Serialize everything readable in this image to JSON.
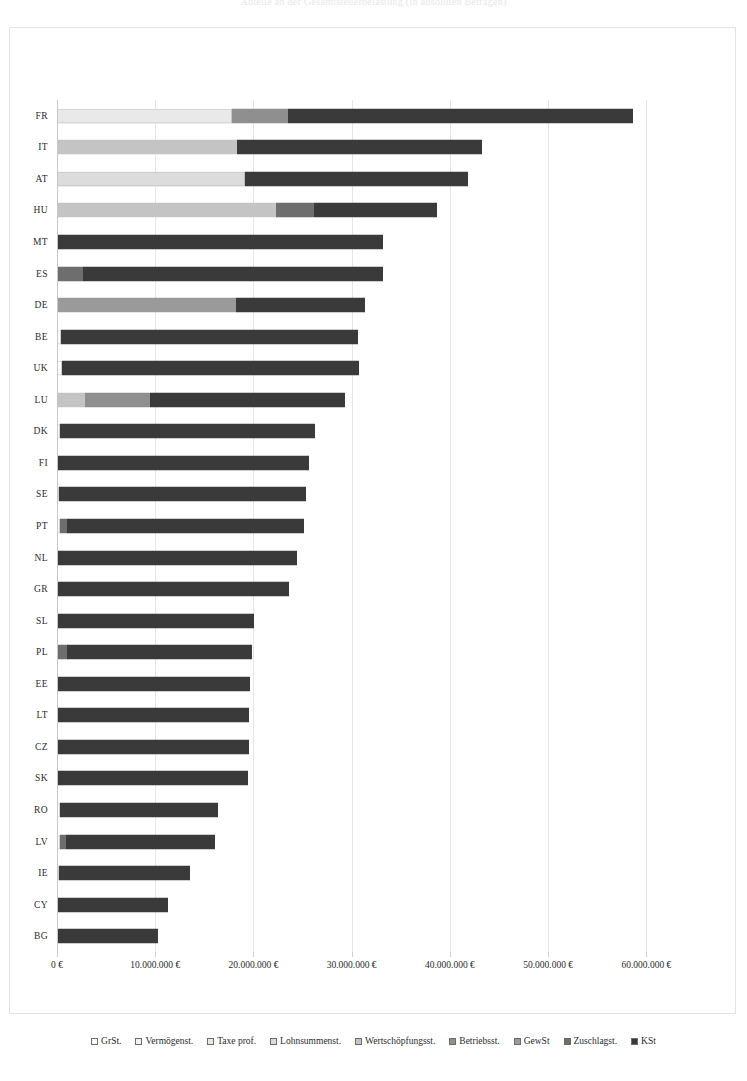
{
  "chart": {
    "title": "Anteile an der Gesamtsteuerbelastung (in absoluten Beträgen)",
    "xlabel": "",
    "ylabel": ""
  },
  "chart_data": {
    "type": "bar",
    "orientation": "horizontal",
    "stacked": true,
    "title": "Anteile an der Gesamtsteuerbelastung (in absoluten Beträgen)",
    "xlabel": "",
    "ylabel": "",
    "xlim": [
      0,
      62000000
    ],
    "grid": true,
    "legend_position": "bottom",
    "xticks": [
      0,
      10000000,
      20000000,
      30000000,
      40000000,
      50000000,
      60000000
    ],
    "xticklabels": [
      "0 €",
      "10.000.000 €",
      "20.000.000 €",
      "30.000.000 €",
      "40.000.000 €",
      "50.000.000 €",
      "60.000.000 €"
    ],
    "categories": [
      "FR",
      "IT",
      "AT",
      "HU",
      "MT",
      "ES",
      "DE",
      "BE",
      "UK",
      "LU",
      "DK",
      "FI",
      "SE",
      "PT",
      "NL",
      "GR",
      "SL",
      "PL",
      "EE",
      "LT",
      "CZ",
      "SK",
      "RO",
      "LV",
      "IE",
      "CY",
      "BG"
    ],
    "series": [
      {
        "name": "GrSt.",
        "color": "#fdfdfd",
        "values": [
          0,
          0,
          0,
          0,
          0,
          0,
          0,
          420000,
          520000,
          0,
          350000,
          0,
          250000,
          300000,
          0,
          0,
          0,
          0,
          0,
          0,
          0,
          0,
          300000,
          260000,
          220000,
          0,
          0
        ]
      },
      {
        "name": "Vermögenst.",
        "color": "#f2f2f2",
        "values": [
          0,
          0,
          0,
          0,
          0,
          0,
          0,
          0,
          0,
          0,
          0,
          0,
          0,
          0,
          0,
          0,
          0,
          0,
          0,
          0,
          0,
          0,
          0,
          0,
          0,
          0,
          0
        ]
      },
      {
        "name": "Taxe prof.",
        "color": "#e9e9e9",
        "values": [
          17800000,
          0,
          0,
          0,
          0,
          0,
          0,
          0,
          0,
          0,
          0,
          0,
          0,
          0,
          0,
          0,
          0,
          0,
          0,
          0,
          0,
          0,
          0,
          0,
          0,
          0,
          0
        ]
      },
      {
        "name": "Lohnsummenst.",
        "color": "#dcdcdc",
        "values": [
          0,
          0,
          19100000,
          0,
          0,
          0,
          0,
          0,
          0,
          0,
          0,
          0,
          0,
          0,
          0,
          0,
          0,
          0,
          0,
          0,
          0,
          0,
          0,
          0,
          0,
          0,
          0
        ]
      },
      {
        "name": "Wertschöpfungsst.",
        "color": "#c4c4c4",
        "values": [
          0,
          18300000,
          0,
          22300000,
          0,
          0,
          0,
          0,
          0,
          2900000,
          0,
          0,
          0,
          0,
          0,
          0,
          0,
          0,
          0,
          0,
          0,
          0,
          0,
          0,
          0,
          0,
          0
        ]
      },
      {
        "name": "Betriebsst.",
        "color": "#8f8f8f",
        "values": [
          5700000,
          0,
          0,
          0,
          0,
          0,
          0,
          0,
          0,
          6600000,
          0,
          0,
          0,
          0,
          0,
          0,
          0,
          0,
          0,
          0,
          0,
          0,
          0,
          0,
          0,
          0,
          0
        ]
      },
      {
        "name": "GewSt",
        "color": "#9a9a9a",
        "values": [
          0,
          0,
          0,
          0,
          0,
          0,
          18200000,
          0,
          0,
          0,
          0,
          0,
          0,
          0,
          0,
          0,
          0,
          0,
          0,
          0,
          0,
          0,
          0,
          0,
          0,
          0,
          0
        ]
      },
      {
        "name": "Zuschlagst.",
        "color": "#6e6e6e",
        "values": [
          0,
          0,
          0,
          3900000,
          0,
          2600000,
          0,
          0,
          0,
          0,
          0,
          0,
          0,
          700000,
          0,
          0,
          0,
          1000000,
          0,
          0,
          0,
          0,
          0,
          700000,
          0,
          0,
          0
        ]
      },
      {
        "name": "KSt",
        "color": "#3a3a3a",
        "values": [
          35100000,
          25000000,
          22700000,
          12500000,
          33200000,
          30600000,
          13200000,
          30200000,
          30200000,
          19800000,
          25900000,
          25700000,
          25100000,
          24100000,
          24400000,
          23600000,
          20100000,
          18900000,
          19600000,
          19500000,
          19500000,
          19400000,
          16100000,
          15100000,
          13300000,
          11300000,
          10300000
        ]
      }
    ]
  },
  "legend": {
    "items": [
      {
        "label": "GrSt.",
        "color": "#fdfdfd"
      },
      {
        "label": "Vermögenst.",
        "color": "#f2f2f2"
      },
      {
        "label": "Taxe prof.",
        "color": "#e9e9e9"
      },
      {
        "label": "Lohnsummenst.",
        "color": "#dcdcdc"
      },
      {
        "label": "Wertschöpfungsst.",
        "color": "#c4c4c4"
      },
      {
        "label": "Betriebsst.",
        "color": "#8f8f8f"
      },
      {
        "label": "GewSt",
        "color": "#9a9a9a"
      },
      {
        "label": "Zuschlagst.",
        "color": "#6e6e6e"
      },
      {
        "label": "KSt",
        "color": "#3a3a3a"
      }
    ]
  }
}
